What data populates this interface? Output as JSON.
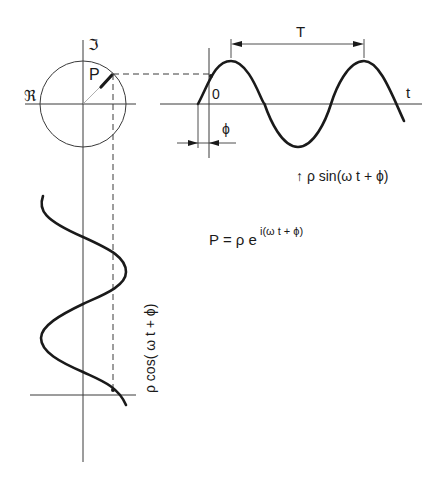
{
  "diagram": {
    "labels": {
      "imag_axis": "ℑ",
      "real_axis": "ℜ",
      "point": "P",
      "origin": "0",
      "time_axis": "t",
      "period": "T",
      "phase": "ϕ",
      "sine_expr": "↑ ρ sin(ω t + ϕ)",
      "cos_expr": "ρ cos( ω t + ϕ)",
      "formula_base": "P = ρ e",
      "formula_exp": "i(ω t + ϕ)"
    },
    "colors": {
      "ink": "#1a1a1a",
      "axis": "#3a3a3a",
      "radius": "#9a9a9a",
      "background": "#ffffff"
    },
    "geometry": {
      "circle_center": [
        83,
        104
      ],
      "radius": 43,
      "point_P": [
        113,
        74
      ],
      "sine_axis_y": 104,
      "sine_start_x": 198,
      "sine_period_px": 133,
      "sine_end_x": 404,
      "cos_axis_x": 83,
      "cos_start_y": 196,
      "cos_end_y": 405,
      "cos_bottom_axis_y": 395
    }
  }
}
